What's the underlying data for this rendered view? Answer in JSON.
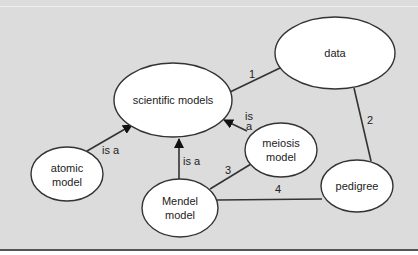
{
  "diagram": {
    "nodes": [
      {
        "id": "scientific-models",
        "label_lines": [
          "scientific models"
        ],
        "cx": 173,
        "cy": 100,
        "rx": 59,
        "ry": 37
      },
      {
        "id": "data",
        "label_lines": [
          "data"
        ],
        "cx": 335,
        "cy": 53,
        "rx": 60,
        "ry": 36
      },
      {
        "id": "meiosis-model",
        "label_lines": [
          "meiosis",
          "model"
        ],
        "cx": 281,
        "cy": 150,
        "rx": 36,
        "ry": 27
      },
      {
        "id": "atomic-model",
        "label_lines": [
          "atomic",
          "model"
        ],
        "cx": 67,
        "cy": 174,
        "rx": 36,
        "ry": 27
      },
      {
        "id": "mendel-model",
        "label_lines": [
          "Mendel",
          "model"
        ],
        "cx": 180,
        "cy": 208,
        "rx": 38,
        "ry": 29
      },
      {
        "id": "pedigree",
        "label_lines": [
          "pedigree"
        ],
        "cx": 357,
        "cy": 186,
        "rx": 36,
        "ry": 26
      }
    ],
    "edges": [
      {
        "from": "scientific-models",
        "to": "data",
        "label": "1"
      },
      {
        "from": "data",
        "to": "pedigree",
        "label": "2"
      },
      {
        "from": "mendel-model",
        "to": "meiosis-model",
        "label": "3"
      },
      {
        "from": "mendel-model",
        "to": "pedigree",
        "label": "4"
      },
      {
        "from": "atomic-model",
        "to": "scientific-models",
        "label": "is a",
        "arrow": true
      },
      {
        "from": "mendel-model",
        "to": "scientific-models",
        "label": "is a",
        "arrow": true
      },
      {
        "from": "meiosis-model",
        "to": "scientific-models",
        "label_lines": [
          "is",
          "a"
        ],
        "arrow": true
      }
    ]
  },
  "text": {
    "node_scientific_models": "scientific models",
    "node_data": "data",
    "node_meiosis_1": "meiosis",
    "node_meiosis_2": "model",
    "node_atomic_1": "atomic",
    "node_atomic_2": "model",
    "node_mendel_1": "Mendel",
    "node_mendel_2": "model",
    "node_pedigree": "pedigree",
    "edge_1": "1",
    "edge_2": "2",
    "edge_3": "3",
    "edge_4": "4",
    "isa_atomic": "is a",
    "isa_mendel": "is a",
    "isa_meiosis_1": "is",
    "isa_meiosis_2": "a"
  },
  "colors": {
    "background": "#dcdcdc",
    "node_fill": "#ffffff",
    "stroke": "#333333",
    "text": "#222222"
  }
}
